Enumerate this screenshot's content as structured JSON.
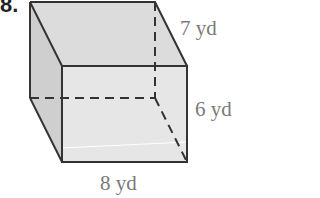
{
  "problem": {
    "number": "8."
  },
  "figure": {
    "type": "rectangular prism",
    "labels": {
      "depth": "7 yd",
      "height": "6 yd",
      "length": "8 yd"
    },
    "colors": {
      "edge": "#333333",
      "face_light": "#e4e4e4",
      "face_mid": "#d6d6d6",
      "face_dark": "#c8c8c8",
      "label": "#7a7a7a"
    }
  }
}
